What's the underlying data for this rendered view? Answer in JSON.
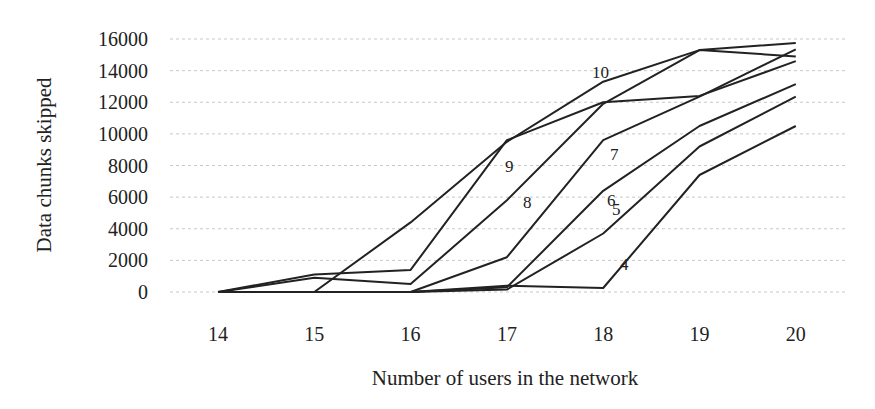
{
  "chart_data": {
    "type": "line",
    "title": "",
    "xlabel": "Number of users in the network",
    "ylabel": "Data chunks skipped",
    "x": [
      14,
      15,
      16,
      17,
      18,
      19,
      20
    ],
    "ylim": [
      0,
      16000
    ],
    "yticks": [
      0,
      2000,
      4000,
      6000,
      8000,
      10000,
      12000,
      14000,
      16000
    ],
    "grid": "horizontal dotted",
    "legend": "inline labels",
    "series": [
      {
        "name": "4",
        "values": [
          0,
          0,
          0,
          400,
          250,
          7400,
          10500
        ],
        "label_at": [
          620,
          270
        ]
      },
      {
        "name": "5",
        "values": [
          0,
          0,
          0,
          150,
          3700,
          9200,
          12350
        ],
        "label_at": [
          612,
          215
        ]
      },
      {
        "name": "6",
        "values": [
          0,
          0,
          0,
          300,
          6400,
          10500,
          13150
        ],
        "label_at": [
          607,
          206
        ]
      },
      {
        "name": "7",
        "values": [
          0,
          0,
          0,
          2200,
          9600,
          12350,
          15350
        ],
        "label_at": [
          610,
          160
        ]
      },
      {
        "name": "8",
        "values": [
          0,
          900,
          500,
          5800,
          11900,
          15300,
          14900
        ],
        "label_at": [
          523,
          208
        ]
      },
      {
        "name": "9",
        "values": [
          0,
          1100,
          1400,
          9600,
          12000,
          12400,
          14600
        ],
        "label_at": [
          505,
          172
        ]
      },
      {
        "name": "10",
        "values": [
          0,
          0,
          4400,
          9500,
          13300,
          15300,
          15750
        ],
        "label_at": [
          592,
          78
        ]
      }
    ]
  },
  "axis": {
    "ylabel": "Data chunks skipped",
    "xlabel": "Number of users in the network"
  }
}
